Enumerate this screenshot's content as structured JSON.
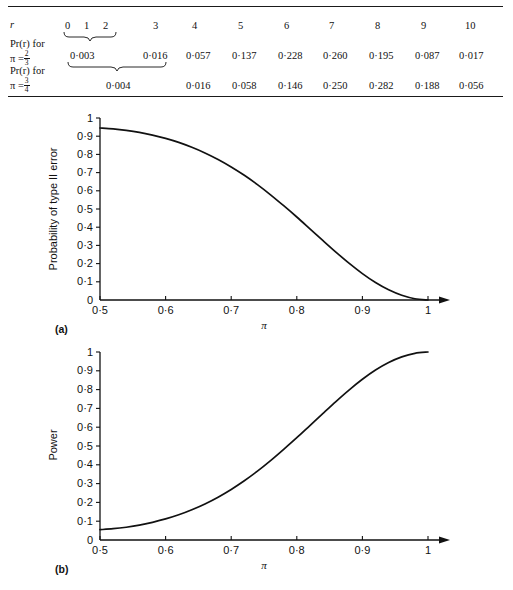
{
  "table": {
    "row_labels": [
      {
        "id": "r",
        "text": "r"
      },
      {
        "id": "pr_2_3_line1",
        "text": "Pr(r) for",
        "pi_label": "π =",
        "num": "2",
        "den": "3"
      },
      {
        "id": "pr_3_4_line1",
        "text": "Pr(r) for",
        "pi_label": "π =",
        "num": "3",
        "den": "4"
      }
    ],
    "columns": [
      "0",
      "1",
      "2",
      "3",
      "4",
      "5",
      "6",
      "7",
      "8",
      "9",
      "10"
    ],
    "rows": [
      {
        "label": "Pr(r) for π = 2/3",
        "values": [
          "0·003",
          "0·016",
          "0·057",
          "0·137",
          "0·228",
          "0·260",
          "0·195",
          "0·087",
          "0·017"
        ],
        "brace_note": "0·003 spans r = 0,1,2"
      },
      {
        "label": "Pr(r) for π = 3/4",
        "values": [
          "0·004",
          "0·016",
          "0·058",
          "0·146",
          "0·250",
          "0·282",
          "0·188",
          "0·056"
        ],
        "brace_note": "0·004 spans r = 0,1,2,3"
      }
    ]
  },
  "chart_data": [
    {
      "id": "a",
      "type": "line",
      "panel_label": "(a)",
      "title": "",
      "xlabel": "π",
      "ylabel": "Probability of type II error",
      "xlim": [
        0.5,
        1
      ],
      "ylim": [
        0,
        1
      ],
      "xticks": [
        "0·5",
        "0·6",
        "0·7",
        "0·8",
        "0·9",
        "1"
      ],
      "xtick_values": [
        0.5,
        0.6,
        0.7,
        0.8,
        0.9,
        1.0
      ],
      "yticks": [
        "0",
        "0·1",
        "0·2",
        "0·3",
        "0·4",
        "0·5",
        "0·6",
        "0·7",
        "0·8",
        "0·9",
        "1"
      ],
      "ytick_values": [
        0,
        0.1,
        0.2,
        0.3,
        0.4,
        0.5,
        0.6,
        0.7,
        0.8,
        0.9,
        1.0
      ],
      "grid": false,
      "legend": "none",
      "x": [
        0.5,
        0.52,
        0.54,
        0.56,
        0.58,
        0.6,
        0.62,
        0.64,
        0.66,
        0.68,
        0.7,
        0.72,
        0.74,
        0.76,
        0.78,
        0.8,
        0.82,
        0.84,
        0.86,
        0.88,
        0.9,
        0.92,
        0.94,
        0.96,
        0.98,
        1.0
      ],
      "y": [
        0.945,
        0.94,
        0.932,
        0.921,
        0.906,
        0.888,
        0.866,
        0.839,
        0.808,
        0.772,
        0.731,
        0.685,
        0.634,
        0.578,
        0.518,
        0.456,
        0.391,
        0.326,
        0.262,
        0.201,
        0.145,
        0.096,
        0.056,
        0.026,
        0.007,
        0.0
      ]
    },
    {
      "id": "b",
      "type": "line",
      "panel_label": "(b)",
      "title": "",
      "xlabel": "π",
      "ylabel": "Power",
      "xlim": [
        0.5,
        1
      ],
      "ylim": [
        0,
        1
      ],
      "xticks": [
        "0·5",
        "0·6",
        "0·7",
        "0·8",
        "0·9",
        "1"
      ],
      "xtick_values": [
        0.5,
        0.6,
        0.7,
        0.8,
        0.9,
        1.0
      ],
      "yticks": [
        "0",
        "0·1",
        "0·2",
        "0·3",
        "0·4",
        "0·5",
        "0·6",
        "0·7",
        "0·8",
        "0·9",
        "1"
      ],
      "ytick_values": [
        0,
        0.1,
        0.2,
        0.3,
        0.4,
        0.5,
        0.6,
        0.7,
        0.8,
        0.9,
        1.0
      ],
      "grid": false,
      "legend": "none",
      "x": [
        0.5,
        0.52,
        0.54,
        0.56,
        0.58,
        0.6,
        0.62,
        0.64,
        0.66,
        0.68,
        0.7,
        0.72,
        0.74,
        0.76,
        0.78,
        0.8,
        0.82,
        0.84,
        0.86,
        0.88,
        0.9,
        0.92,
        0.94,
        0.96,
        0.98,
        1.0
      ],
      "y": [
        0.055,
        0.06,
        0.068,
        0.079,
        0.094,
        0.112,
        0.134,
        0.161,
        0.192,
        0.228,
        0.269,
        0.315,
        0.366,
        0.422,
        0.482,
        0.544,
        0.609,
        0.674,
        0.738,
        0.799,
        0.855,
        0.904,
        0.944,
        0.974,
        0.993,
        1.0
      ]
    }
  ],
  "colors": {
    "ink": "#111111",
    "background": "#ffffff"
  }
}
